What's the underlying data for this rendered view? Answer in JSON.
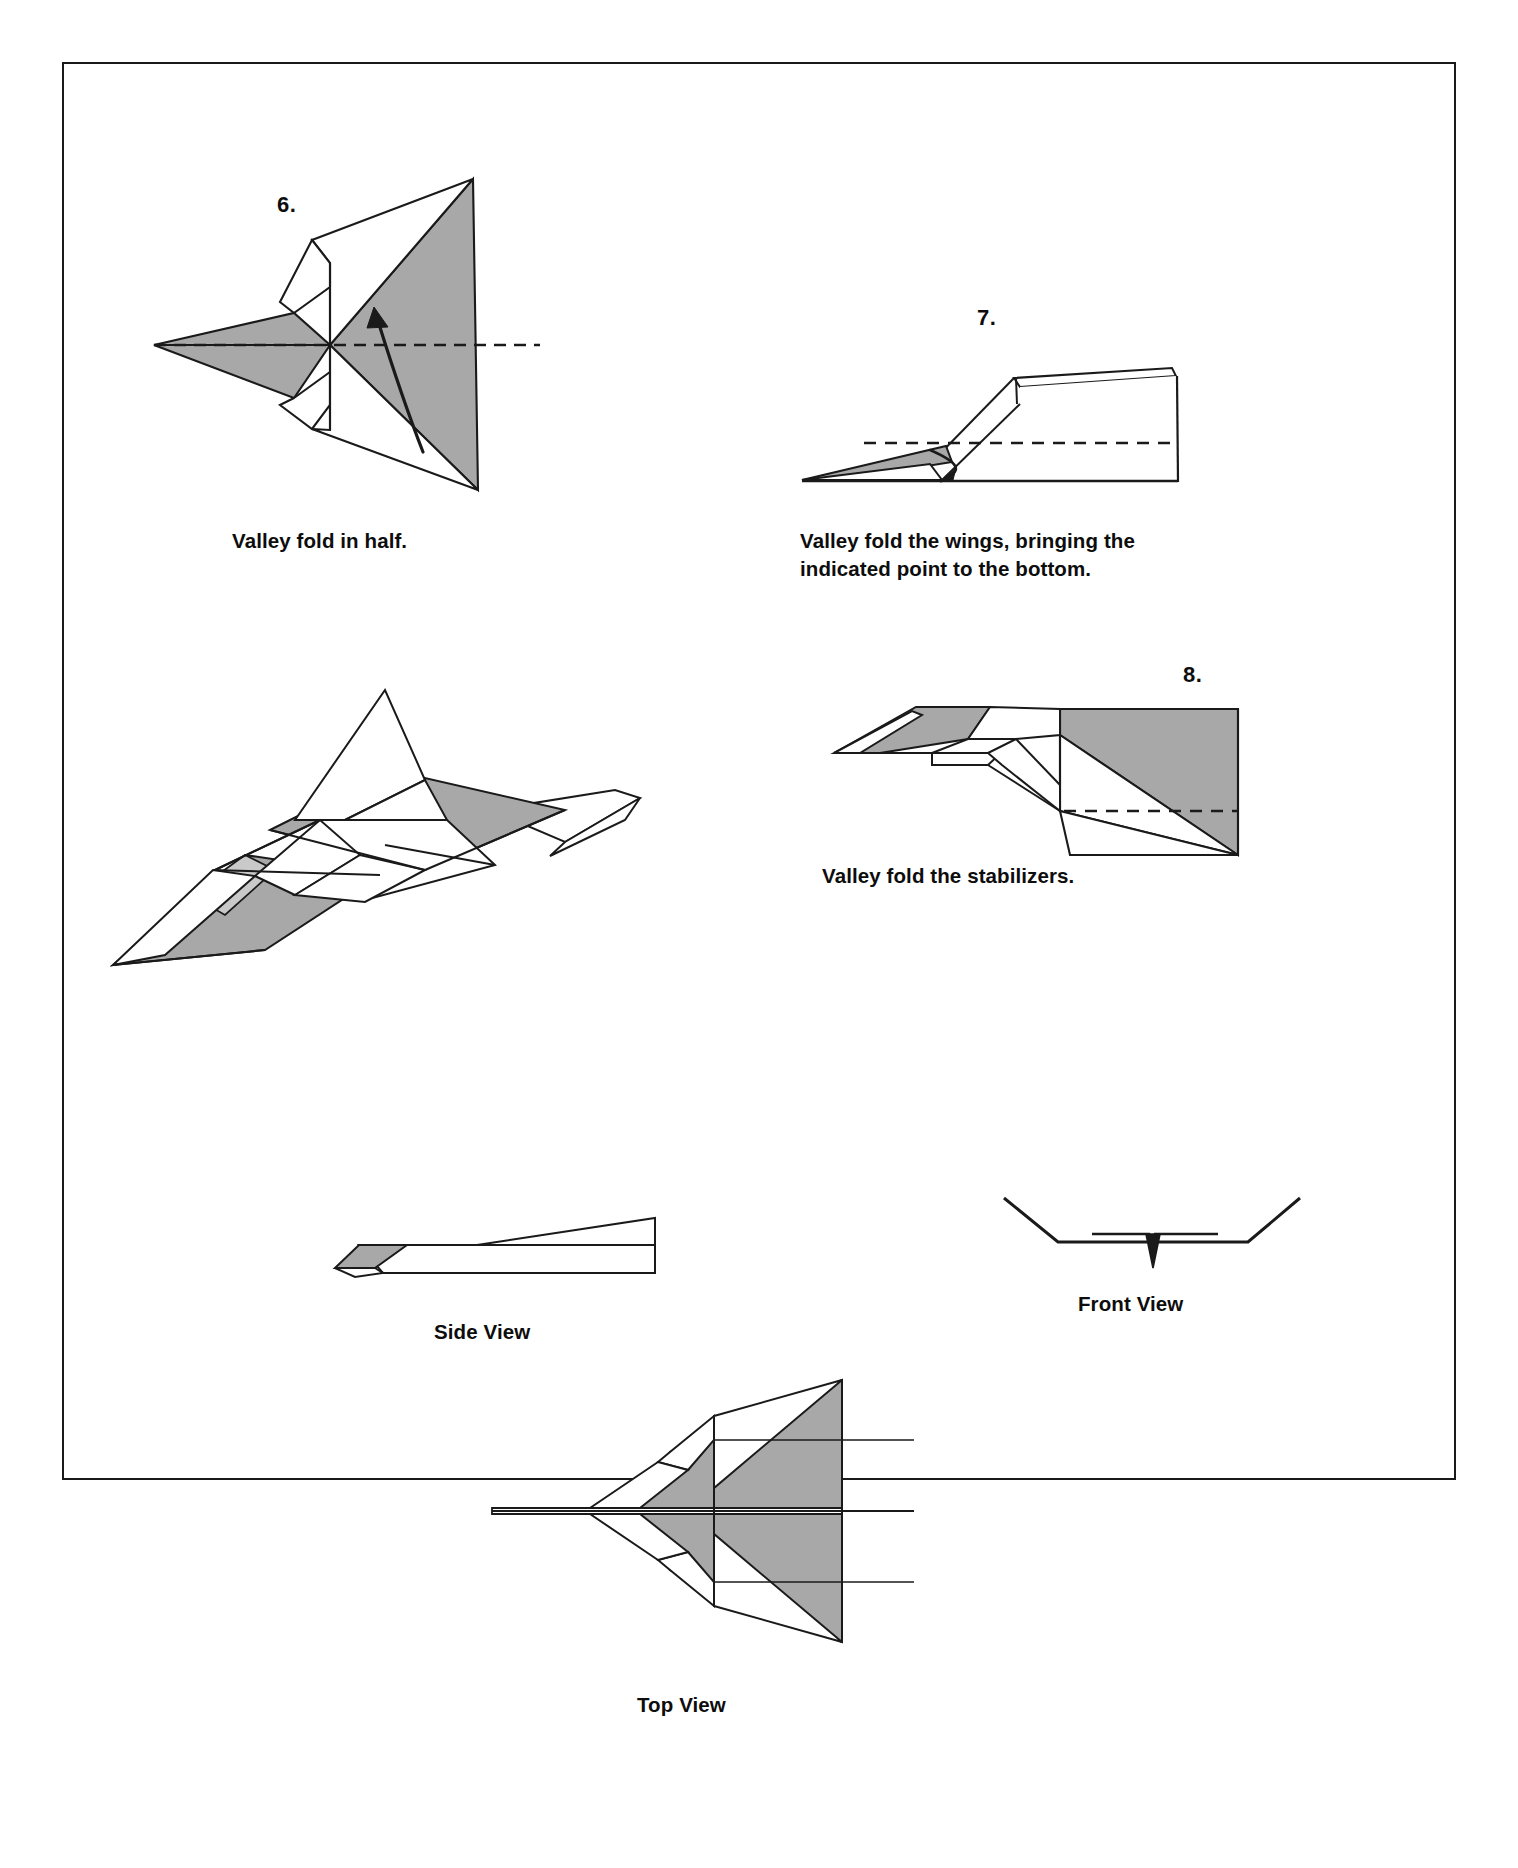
{
  "document": {
    "type": "origami-folding-instructions",
    "title": "Paper airplane folding steps 6-8",
    "background_color": "#ffffff",
    "border_color": "#1a1a1a"
  },
  "colors": {
    "line": "#1a1a1a",
    "shaded_paper": "#a8a8a8",
    "white_paper": "#ffffff",
    "light_shade": "#c9c9c9",
    "text": "#0d0d0d"
  },
  "steps": [
    {
      "number": "6.",
      "caption": "Valley fold in half.",
      "figure": "step6-diagram",
      "fold_type": "valley",
      "has_dashed_fold_line": true,
      "has_curved_arrow": true
    },
    {
      "number": "7.",
      "caption": "Valley fold the wings, bringing the\nindicated point to the bottom.",
      "figure": "step7-diagram",
      "fold_type": "valley",
      "has_dashed_fold_line": true,
      "has_curved_arrow": true
    },
    {
      "number": "8.",
      "caption": "Valley fold the stabilizers.",
      "figure": "step8-diagram",
      "fold_type": "valley",
      "has_dashed_fold_line": true,
      "has_curved_arrow": false
    }
  ],
  "views": [
    {
      "label": "Side View",
      "figure": "side-view-diagram"
    },
    {
      "label": "Front View",
      "figure": "front-view-diagram"
    },
    {
      "label": "Top View",
      "figure": "top-view-diagram"
    }
  ],
  "completed_model": {
    "figure": "finished-model-perspective",
    "label": ""
  }
}
